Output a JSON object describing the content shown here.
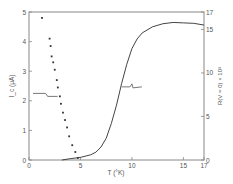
{
  "chart_data": {
    "type": "scatter",
    "title": "",
    "xlabel": "T (°K)",
    "ylabel": "I_c (μA)",
    "y2label": "R(V = 0) × 10³",
    "xlim": [
      0,
      17
    ],
    "ylim": [
      0,
      5
    ],
    "y2lim": [
      0,
      17
    ],
    "x_ticks": [
      0,
      5,
      10,
      15,
      17
    ],
    "y_ticks": [
      0,
      1,
      2,
      3,
      4,
      5
    ],
    "y2_ticks": [
      0,
      5,
      10,
      15,
      17
    ],
    "grid": false,
    "series": [
      {
        "name": "I_c",
        "axis": "left",
        "style": "points",
        "x": [
          1.26,
          2.0,
          2.1,
          2.2,
          2.35,
          2.5,
          2.7,
          2.8,
          3.0,
          3.1,
          3.3,
          3.5,
          3.7,
          3.9,
          4.2,
          4.5,
          4.75
        ],
        "y": [
          4.8,
          4.1,
          3.85,
          3.5,
          3.3,
          3.05,
          2.7,
          2.45,
          2.15,
          1.9,
          1.6,
          1.35,
          1.1,
          0.8,
          0.5,
          0.27,
          0.07
        ]
      },
      {
        "name": "R(V = 0)",
        "axis": "right",
        "style": "line",
        "x": [
          3.2,
          4.0,
          5.0,
          6.0,
          6.5,
          7.0,
          7.5,
          8.0,
          8.5,
          9.0,
          9.5,
          10.0,
          10.5,
          11.0,
          12.0,
          13.0,
          14.0,
          15.0,
          16.0,
          17.0
        ],
        "y": [
          0.0,
          0.15,
          0.3,
          0.6,
          0.9,
          1.5,
          2.5,
          4.2,
          6.3,
          8.8,
          11.0,
          12.8,
          13.9,
          14.6,
          15.3,
          15.65,
          15.8,
          15.75,
          15.7,
          15.5
        ]
      }
    ],
    "annotations": [
      {
        "label": "arrow-to-left-axis",
        "points_to": "I_c series",
        "at": [
          2.2,
          2.25
        ]
      },
      {
        "label": "arrow-to-right-axis",
        "points_to": "R series",
        "at": [
          10.0,
          8.4
        ]
      }
    ]
  }
}
